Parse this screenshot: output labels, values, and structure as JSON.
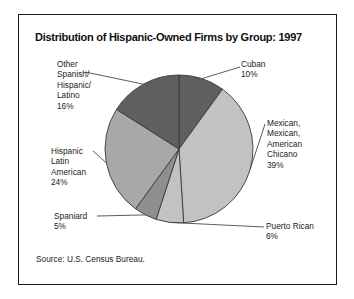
{
  "figure": {
    "title": "Distribution of Hispanic-Owned Firms by Group: 1997",
    "source": "Source:  U.S. Census Bureau."
  },
  "labels": {
    "other": {
      "l1": "Other",
      "l2": "Spanish/",
      "l3": "Hispanic/",
      "l4": "Latino",
      "l5": "16%"
    },
    "cuban": {
      "l1": "Cuban",
      "l2": "10%"
    },
    "mexican": {
      "l1": "Mexican,",
      "l2": "Mexican,",
      "l3": "American",
      "l4": "Chicano",
      "l5": "39%"
    },
    "puerto_rican": {
      "l1": "Puerto Rican",
      "l2": "6%"
    },
    "spaniard": {
      "l1": "Spaniard",
      "l2": "5%"
    },
    "hispanic_latin_american": {
      "l1": "Hispanic",
      "l2": "Latin",
      "l3": "American",
      "l4": "24%"
    }
  },
  "chart_data": {
    "type": "pie",
    "title": "Distribution of Hispanic-Owned Firms by Group: 1997",
    "categories": [
      "Cuban",
      "Mexican, Mexican, American Chicano",
      "Puerto Rican",
      "Spaniard",
      "Hispanic Latin American",
      "Other Spanish/Hispanic/Latino"
    ],
    "values": [
      10,
      39,
      6,
      5,
      24,
      16
    ],
    "value_suffix": "%",
    "colors": [
      "#5f5f5f",
      "#c2c2c2",
      "#c2c2c2",
      "#8f8f8f",
      "#a8a8a8",
      "#5f5f5f"
    ],
    "start_angle_deg": 0,
    "direction": "clockwise",
    "legend": "none",
    "grid": false,
    "labels_placement": "outside-with-leader-lines"
  },
  "geometry": {
    "cx": 160,
    "cy": 134,
    "r": 74,
    "slice_edge": "#3a3a3a",
    "leader_color": "#4a4a4a"
  }
}
